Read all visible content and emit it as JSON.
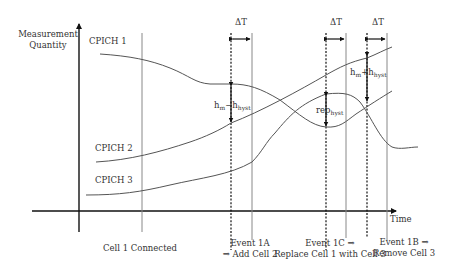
{
  "axes": {
    "y_label_line1": "Measurement",
    "y_label_line2": "Quantity",
    "x_label": "Time"
  },
  "curves": {
    "cpich1": "CPICH 1",
    "cpich2": "CPICH 2",
    "cpich3": "CPICH 3"
  },
  "intervals": {
    "dt1": "ΔT",
    "dt2": "ΔT",
    "dt3": "ΔT"
  },
  "annotations": {
    "hm_minus": {
      "main": "h",
      "sub1": "m",
      "op": "−h",
      "sub2": "hyst"
    },
    "rep_hyst": {
      "main": "rep",
      "sub": "hyst"
    },
    "hm_plus": {
      "main": "h",
      "sub1": "m",
      "op": "+h",
      "sub2": "hyst"
    }
  },
  "events": {
    "cell1": "Cell 1 Connected",
    "e1a_line1": "Event 1A",
    "e1a_line2": "⇒ Add Cell 2",
    "e1c_line1": "Event 1C ⇒",
    "e1c_line2": "Replace Cell 1 with Cell 3",
    "e1b_line1": "Event 1B ⇒",
    "e1b_line2": "Remove Cell 3"
  },
  "colors": {
    "axis": "#111111",
    "curve": "#555555",
    "guide": "#888888",
    "text": "#333333"
  }
}
